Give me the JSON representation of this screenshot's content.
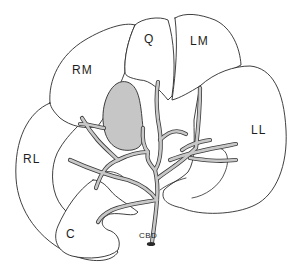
{
  "diagram": {
    "colors": {
      "outline": "#2a2a2a",
      "gallbladder": "#c6c6c6",
      "duct": "#c8c8c8",
      "background": "#ffffff"
    },
    "labels": {
      "rm": "RM",
      "q": "Q",
      "lm": "LM",
      "ll": "LL",
      "rl": "RL",
      "c": "C",
      "cbd": "CBD"
    }
  }
}
